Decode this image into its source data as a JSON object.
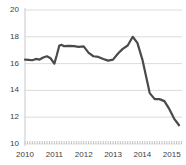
{
  "chart_data": {
    "type": "line",
    "title": "",
    "xlabel": "",
    "ylabel": "",
    "xlim": [
      2010.0,
      2015.35
    ],
    "ylim": [
      10,
      20
    ],
    "grid": true,
    "legend": false,
    "y_ticks": [
      20,
      18,
      16,
      14,
      12,
      10
    ],
    "x_ticks": [
      2010,
      2011,
      2012,
      2013,
      2014,
      2015
    ],
    "y_tick_labels": [
      "20",
      "18",
      "16",
      "14",
      "12",
      "10"
    ],
    "x_tick_labels": [
      "2010",
      "2011",
      "2012",
      "2013",
      "2014",
      "2015"
    ],
    "line_color": "#4a4a4a",
    "line_width": 2.2,
    "series": [
      {
        "name": "series-1",
        "x": [
          2010.0,
          2010.12,
          2010.25,
          2010.37,
          2010.5,
          2010.62,
          2010.75,
          2010.87,
          2011.0,
          2011.08,
          2011.17,
          2011.25,
          2011.33,
          2011.5,
          2011.67,
          2011.83,
          2012.0,
          2012.17,
          2012.33,
          2012.5,
          2012.67,
          2012.83,
          2013.0,
          2013.17,
          2013.33,
          2013.5,
          2013.67,
          2013.83,
          2014.0,
          2014.17,
          2014.25,
          2014.42,
          2014.58,
          2014.75,
          2014.92,
          2015.08,
          2015.25
        ],
        "y": [
          16.3,
          16.28,
          16.25,
          16.35,
          16.3,
          16.45,
          16.55,
          16.4,
          16.0,
          16.6,
          17.35,
          17.4,
          17.3,
          17.32,
          17.3,
          17.25,
          17.28,
          16.8,
          16.55,
          16.5,
          16.35,
          16.22,
          16.3,
          16.75,
          17.1,
          17.35,
          18.0,
          17.55,
          16.3,
          14.6,
          13.8,
          13.35,
          13.35,
          13.2,
          12.6,
          11.9,
          11.4
        ]
      }
    ]
  }
}
